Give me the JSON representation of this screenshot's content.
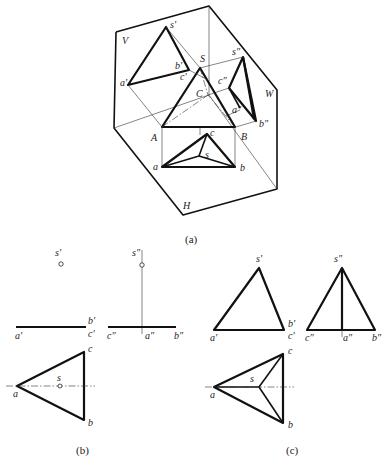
{
  "figure_a": {
    "caption": "(a)",
    "plane_labels": {
      "V": "V",
      "W": "W",
      "H": "H"
    },
    "space_points": {
      "S": "S",
      "A": "A",
      "B": "B",
      "C": "C"
    },
    "v_projection": {
      "s": "s'",
      "a": "a'",
      "b": "b'",
      "c": "c'"
    },
    "w_projection": {
      "s": "s″",
      "a": "a″",
      "b": "b″",
      "c": "c″"
    },
    "h_projection": {
      "s": "s",
      "a": "a",
      "b": "b",
      "c": "c"
    }
  },
  "figure_b": {
    "caption": "(b)",
    "v_view": {
      "s": "s'",
      "a": "a'",
      "b": "b'",
      "c": "c'"
    },
    "w_view": {
      "s": "s″",
      "a": "a″",
      "b": "b″",
      "c": "c″"
    },
    "h_view": {
      "s": "s",
      "a": "a",
      "b": "b",
      "c": "c"
    }
  },
  "figure_c": {
    "caption": "(c)",
    "v_view": {
      "s": "s'",
      "a": "a'",
      "b": "b'",
      "c": "c'"
    },
    "w_view": {
      "s": "s″",
      "a": "a″",
      "b": "b″",
      "c": "c″"
    },
    "h_view": {
      "s": "s",
      "a": "a",
      "b": "b",
      "c": "c"
    }
  }
}
